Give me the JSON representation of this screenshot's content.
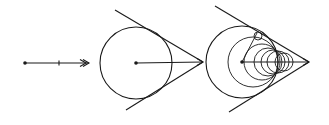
{
  "figure": {
    "panels": [
      {
        "id": "panel-1-ray",
        "description": "Horizontal ray with start point, midpoint tick and double arrowhead",
        "line": {
          "x1": 25,
          "y1": 63,
          "x2": 89,
          "y2": 63
        },
        "start_point": {
          "cx": 25,
          "cy": 63
        },
        "tick": {
          "x": 59,
          "y": 63
        },
        "arrowhead": {
          "x": 89,
          "y": 63,
          "style": "double"
        }
      },
      {
        "id": "panel-2-cone",
        "description": "Circle with radius arrow and two tangent lines meeting at an apex",
        "circle": {
          "cx": 136,
          "cy": 63,
          "r": 36
        },
        "center_point": {
          "cx": 136,
          "cy": 63
        },
        "axis": {
          "x1": 136,
          "y1": 63,
          "x2": 203,
          "y2": 62
        },
        "apex": {
          "x": 203,
          "y": 62
        },
        "tangent_top": {
          "x1": 115,
          "y1": 10,
          "x2": 203,
          "y2": 62
        },
        "tangent_bottom": {
          "x1": 126,
          "y1": 110,
          "x2": 203,
          "y2": 62
        }
      },
      {
        "id": "panel-3-nested-circles",
        "description": "Sequence of shrinking circles inscribed in a cone converging on the apex",
        "center_point": {
          "cx": 242,
          "cy": 62
        },
        "axis": {
          "x1": 242,
          "y1": 62,
          "x2": 309,
          "y2": 62
        },
        "apex": {
          "x": 309,
          "y": 62
        },
        "tangent_top": {
          "x1": 215,
          "y1": 6,
          "x2": 309,
          "y2": 62
        },
        "tangent_bottom": {
          "x1": 229,
          "y1": 112,
          "x2": 309,
          "y2": 62
        },
        "radius_line": {
          "x1": 242,
          "y1": 62,
          "x2": 257,
          "y2": 33
        },
        "small_marker_circle": {
          "cx": 258,
          "cy": 36,
          "r": 4
        },
        "circles": [
          {
            "cx": 242,
            "cy": 62,
            "r": 36
          },
          {
            "cx": 253,
            "cy": 62,
            "r": 25
          },
          {
            "cx": 262,
            "cy": 62,
            "r": 18
          },
          {
            "cx": 268,
            "cy": 62,
            "r": 14
          },
          {
            "cx": 273,
            "cy": 62,
            "r": 12
          },
          {
            "cx": 278,
            "cy": 62,
            "r": 11
          },
          {
            "cx": 284,
            "cy": 62,
            "r": 9
          }
        ]
      }
    ],
    "stroke_color": "#1a1a1a",
    "background": "#ffffff"
  }
}
